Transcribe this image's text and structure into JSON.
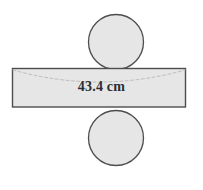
{
  "figure": {
    "dimension_label": "43.4 cm",
    "colors": {
      "shape_fill": "#e6e6e6",
      "shape_stroke": "#4d4d4d",
      "hidden_edge": "#b9b9b9",
      "label_text": "#2e2e2e",
      "background": "#ffffff"
    },
    "parts": {
      "top_circle": "top-circle",
      "bottom_circle": "bottom-circle",
      "rectangle": "lateral-rectangle",
      "hidden_arc": "hidden-ellipse-arc"
    },
    "geometry": {
      "circle_diameter_px": 56,
      "circle_center_x_px": 116,
      "top_circle_center_y_px": 42,
      "bottom_circle_center_y_px": 138,
      "rect_left_px": 12,
      "rect_top_px": 68,
      "rect_right_px": 186,
      "rect_bottom_px": 107
    }
  }
}
